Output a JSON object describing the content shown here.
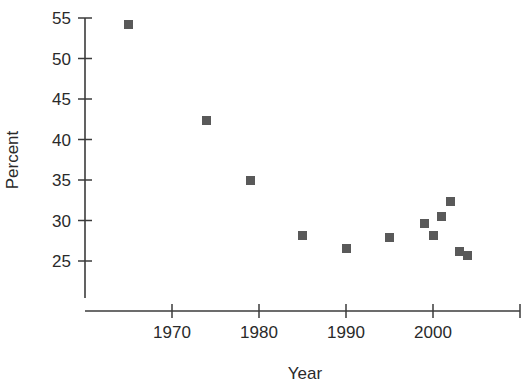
{
  "chart_data": {
    "type": "scatter",
    "title": "",
    "xlabel": "Year",
    "ylabel": "Percent",
    "xlim": [
      1961,
      2010
    ],
    "ylim": [
      23.4,
      56.2
    ],
    "grid": false,
    "legend": null,
    "marker_color": "#595959",
    "axis_color": "#3b3b3b",
    "x_ticks": [
      1970,
      1980,
      1990,
      2000,
      2010
    ],
    "x_tick_labels": [
      "1970",
      "1980",
      "1990",
      "2000",
      ""
    ],
    "y_ticks": [
      25,
      30,
      35,
      40,
      45,
      50,
      55
    ],
    "y_tick_labels": [
      "25",
      "30",
      "35",
      "40",
      "45",
      "50",
      "55"
    ],
    "series": [
      {
        "name": "Percent",
        "points": [
          {
            "x": 1965,
            "y": 54.2
          },
          {
            "x": 1974,
            "y": 42.3
          },
          {
            "x": 1979,
            "y": 35.0
          },
          {
            "x": 1985,
            "y": 28.1
          },
          {
            "x": 1990,
            "y": 26.5
          },
          {
            "x": 1995,
            "y": 27.9
          },
          {
            "x": 1999,
            "y": 29.6
          },
          {
            "x": 2000,
            "y": 28.2
          },
          {
            "x": 2001,
            "y": 30.5
          },
          {
            "x": 2002,
            "y": 32.3
          },
          {
            "x": 2003,
            "y": 26.2
          },
          {
            "x": 2004,
            "y": 25.7
          }
        ]
      }
    ]
  },
  "axis_titles": {
    "x": "Year",
    "y": "Percent"
  }
}
